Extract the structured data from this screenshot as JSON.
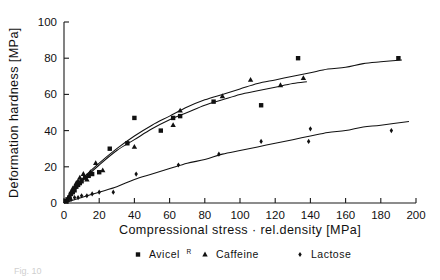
{
  "chart_data": {
    "type": "scatter",
    "title": "",
    "xlabel": "Compressional stress · rel.density [MPa]",
    "ylabel": "Deformation hardness [MPa]",
    "xlim": [
      0,
      200
    ],
    "ylim": [
      0,
      100
    ],
    "xticks": [
      0,
      20,
      40,
      60,
      80,
      100,
      120,
      140,
      160,
      180,
      200
    ],
    "yticks": [
      0,
      20,
      40,
      60,
      80,
      100
    ],
    "xticklabels": [
      "0",
      "20",
      "40",
      "60",
      "80",
      "100",
      "120",
      "140",
      "160",
      "180",
      "200"
    ],
    "yticklabels": [
      "0",
      "20",
      "40",
      "60",
      "80",
      "100"
    ],
    "grid": false,
    "legend_position": "below-axes",
    "series": [
      {
        "name": "Avicel",
        "name_suffix": "R",
        "marker": "square",
        "points": [
          [
            1,
            1
          ],
          [
            2,
            2
          ],
          [
            3,
            3
          ],
          [
            4,
            5
          ],
          [
            5,
            6
          ],
          [
            6,
            7
          ],
          [
            7,
            9
          ],
          [
            8,
            10
          ],
          [
            9,
            11
          ],
          [
            10,
            12
          ],
          [
            12,
            14
          ],
          [
            14,
            15
          ],
          [
            16,
            16
          ],
          [
            20,
            17
          ],
          [
            26,
            30
          ],
          [
            36,
            33
          ],
          [
            40,
            47
          ],
          [
            55,
            40
          ],
          [
            62,
            47
          ],
          [
            66,
            48
          ],
          [
            85,
            56
          ],
          [
            112,
            54
          ],
          [
            133,
            80
          ],
          [
            190,
            80
          ]
        ],
        "fit": {
          "model": "saturating",
          "points": [
            [
              0,
              0
            ],
            [
              5,
              7
            ],
            [
              10,
              13
            ],
            [
              20,
              22
            ],
            [
              30,
              30
            ],
            [
              40,
              37
            ],
            [
              50,
              43
            ],
            [
              60,
              48
            ],
            [
              70,
              53
            ],
            [
              80,
              57
            ],
            [
              90,
              60
            ],
            [
              100,
              63
            ],
            [
              110,
              66
            ],
            [
              120,
              68
            ],
            [
              130,
              70
            ],
            [
              140,
              72
            ],
            [
              150,
              74
            ],
            [
              160,
              75
            ],
            [
              170,
              77
            ],
            [
              180,
              78
            ],
            [
              192,
              79
            ]
          ]
        }
      },
      {
        "name": "Caffeine",
        "marker": "triangle",
        "points": [
          [
            2,
            2
          ],
          [
            3,
            4
          ],
          [
            4,
            6
          ],
          [
            5,
            8
          ],
          [
            6,
            9
          ],
          [
            7,
            11
          ],
          [
            8,
            12
          ],
          [
            9,
            14
          ],
          [
            11,
            16
          ],
          [
            13,
            13
          ],
          [
            15,
            17
          ],
          [
            18,
            22
          ],
          [
            22,
            18
          ],
          [
            40,
            31
          ],
          [
            62,
            43
          ],
          [
            66,
            51
          ],
          [
            90,
            59
          ],
          [
            106,
            68
          ],
          [
            123,
            65
          ],
          [
            136,
            69
          ]
        ],
        "fit": {
          "model": "saturating",
          "points": [
            [
              0,
              0
            ],
            [
              5,
              6
            ],
            [
              10,
              12
            ],
            [
              20,
              21
            ],
            [
              30,
              29
            ],
            [
              40,
              35
            ],
            [
              50,
              41
            ],
            [
              60,
              46
            ],
            [
              70,
              50
            ],
            [
              80,
              54
            ],
            [
              90,
              57
            ],
            [
              100,
              60
            ],
            [
              110,
              62
            ],
            [
              120,
              64
            ],
            [
              130,
              66
            ],
            [
              138,
              67
            ]
          ]
        }
      },
      {
        "name": "Lactose",
        "marker": "diamond",
        "points": [
          [
            2,
            1
          ],
          [
            4,
            2
          ],
          [
            6,
            3
          ],
          [
            8,
            3
          ],
          [
            10,
            4
          ],
          [
            13,
            4
          ],
          [
            16,
            5
          ],
          [
            20,
            6
          ],
          [
            28,
            6
          ],
          [
            41,
            16
          ],
          [
            65,
            21
          ],
          [
            88,
            27
          ],
          [
            112,
            34
          ],
          [
            139,
            34
          ],
          [
            140,
            41
          ],
          [
            186,
            40
          ]
        ],
        "fit": {
          "model": "saturating",
          "points": [
            [
              0,
              0
            ],
            [
              10,
              3
            ],
            [
              20,
              6
            ],
            [
              30,
              9
            ],
            [
              40,
              13
            ],
            [
              50,
              16
            ],
            [
              60,
              19
            ],
            [
              70,
              22
            ],
            [
              80,
              24
            ],
            [
              90,
              27
            ],
            [
              100,
              29
            ],
            [
              110,
              31
            ],
            [
              120,
              33
            ],
            [
              130,
              35
            ],
            [
              140,
              37
            ],
            [
              150,
              39
            ],
            [
              160,
              40
            ],
            [
              170,
              42
            ],
            [
              180,
              43
            ],
            [
              196,
              45
            ]
          ]
        }
      }
    ],
    "legend": [
      {
        "marker": "square",
        "label": "Avicel",
        "sup": "R"
      },
      {
        "marker": "triangle",
        "label": "Caffeine",
        "sup": ""
      },
      {
        "marker": "diamond",
        "label": "Lactose",
        "sup": ""
      }
    ]
  },
  "caption": {
    "text": "Fig. 10"
  }
}
